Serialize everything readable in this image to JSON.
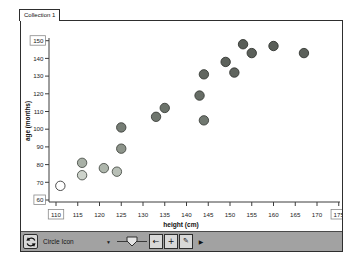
{
  "tab": {
    "label": "Collection 1"
  },
  "chart_data": {
    "type": "scatter",
    "title": "",
    "xlabel": "height (cm)",
    "ylabel": "age (months)",
    "xlim": [
      110,
      175
    ],
    "ylim": [
      60,
      150
    ],
    "x_ticks": [
      110,
      115,
      120,
      125,
      130,
      135,
      140,
      145,
      150,
      155,
      160,
      165,
      170,
      175
    ],
    "y_ticks": [
      60,
      70,
      80,
      90,
      100,
      110,
      120,
      130,
      140,
      150
    ],
    "boxed_x_ticks": [
      110,
      175
    ],
    "boxed_y_ticks": [
      60,
      150
    ],
    "grid": false,
    "legend": "none",
    "marker": "circle",
    "points": [
      {
        "x": 111,
        "y": 68,
        "fill": "#ffffff",
        "stroke": "#3a3a3a"
      },
      {
        "x": 116,
        "y": 74,
        "fill": "#cdd3cb",
        "stroke": "#4b504a"
      },
      {
        "x": 116,
        "y": 81,
        "fill": "#a8b0a6",
        "stroke": "#4b504a"
      },
      {
        "x": 121,
        "y": 78,
        "fill": "#aeb6ac",
        "stroke": "#4b504a"
      },
      {
        "x": 124,
        "y": 76,
        "fill": "#b8bfb6",
        "stroke": "#4b504a"
      },
      {
        "x": 125,
        "y": 89,
        "fill": "#8d948b",
        "stroke": "#42463f"
      },
      {
        "x": 125,
        "y": 101,
        "fill": "#767d75",
        "stroke": "#3d413c"
      },
      {
        "x": 133,
        "y": 107,
        "fill": "#6f766e",
        "stroke": "#3d413c"
      },
      {
        "x": 135,
        "y": 112,
        "fill": "#6b726a",
        "stroke": "#3d413c"
      },
      {
        "x": 143,
        "y": 119,
        "fill": "#676d66",
        "stroke": "#383c37"
      },
      {
        "x": 144,
        "y": 105,
        "fill": "#717870",
        "stroke": "#3d413c"
      },
      {
        "x": 144,
        "y": 131,
        "fill": "#616660",
        "stroke": "#383c37"
      },
      {
        "x": 149,
        "y": 138,
        "fill": "#5d625c",
        "stroke": "#343733"
      },
      {
        "x": 151,
        "y": 132,
        "fill": "#5f645e",
        "stroke": "#343733"
      },
      {
        "x": 153,
        "y": 148,
        "fill": "#595e58",
        "stroke": "#313430"
      },
      {
        "x": 155,
        "y": 143,
        "fill": "#5b605a",
        "stroke": "#313430"
      },
      {
        "x": 160,
        "y": 147,
        "fill": "#595e58",
        "stroke": "#313430"
      },
      {
        "x": 167,
        "y": 143,
        "fill": "#5b605a",
        "stroke": "#313430"
      }
    ]
  },
  "toolbar": {
    "mix_icon": "mix-rotate-arrows",
    "icon_type": {
      "label": "Circle Icon",
      "arrow": "▼"
    },
    "slider_name": "icon-size-slider",
    "back_label": "←",
    "add_label": "+",
    "draw_label": "✎",
    "expand_label": "▶"
  },
  "colors": {
    "toolbar_bg": "#a2a2a2",
    "button_bg": "#d8d8d8",
    "window_border": "#2e2e2e",
    "axis": "#3c3c3c",
    "tick_text": "#1c1c1c",
    "boxed_label_border": "#8a8a8a"
  }
}
